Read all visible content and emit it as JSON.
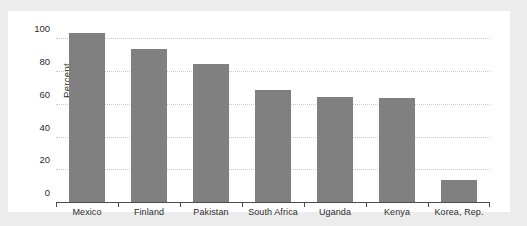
{
  "page": {
    "top_remnant_text": "",
    "background_color": "#ececed",
    "card_color": "#ffffff"
  },
  "chart_data": {
    "type": "bar",
    "title": "",
    "xlabel": "",
    "ylabel": "Percent",
    "ylim": [
      0,
      110
    ],
    "yticks": [
      0,
      20,
      40,
      60,
      80,
      100
    ],
    "grid": true,
    "legend": false,
    "bar_color": "#808080",
    "categories": [
      "Mexico",
      "Finland",
      "Pakistan",
      "South Africa",
      "Uganda",
      "Kenya",
      "Korea, Rep."
    ],
    "values": [
      104,
      94,
      85,
      69,
      65,
      64,
      14
    ]
  }
}
